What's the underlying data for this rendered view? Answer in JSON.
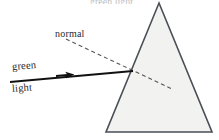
{
  "figure": {
    "title_fragment_cropped": "green light prism",
    "background_color": "#ffffff",
    "width": 219,
    "height": 140
  },
  "labels": {
    "normal": "normal",
    "green": "green",
    "light": "light"
  },
  "prism": {
    "name": "triangular-prism",
    "fill_color": "#f2f2f0",
    "stroke_color": "#4a4f57",
    "stroke_width": 1.6,
    "apex": {
      "x": 159,
      "y": 3
    },
    "bottom_left": {
      "x": 106,
      "y": 132
    },
    "bottom_right": {
      "x": 212,
      "y": 132
    },
    "points": "159,3 212,132 106,132"
  },
  "incident_ray": {
    "name": "green-light-ray",
    "stroke_color": "#111111",
    "stroke_width": 2.1,
    "start": {
      "x": 10,
      "y": 82
    },
    "end": {
      "x": 133,
      "y": 71
    },
    "arrowhead_at": {
      "x": 70,
      "y": 75
    }
  },
  "normal_line": {
    "name": "normal-dashed-line",
    "stroke_color": "#555555",
    "stroke_width": 1.1,
    "dash_pattern": "4 3",
    "start": {
      "x": 66,
      "y": 39
    },
    "end": {
      "x": 172,
      "y": 89
    }
  },
  "incidence_point": {
    "x": 133,
    "y": 71
  }
}
